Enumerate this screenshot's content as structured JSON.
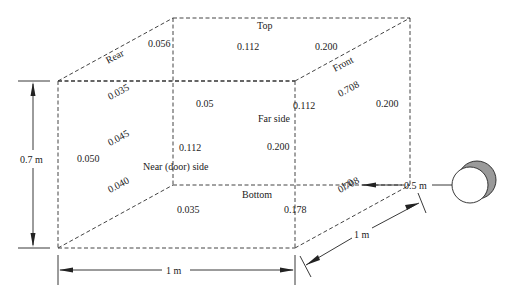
{
  "diagram": {
    "faces": {
      "top": "Top",
      "rear": "Rear",
      "front": "Front",
      "far_side": "Far side",
      "near_side": "Near (door) side",
      "bottom": "Bottom"
    },
    "values": {
      "top_rear": "0.056",
      "top_center": "0.112",
      "top_front": "0.200",
      "rear_upper": "0.035",
      "rear_mid": "0.045",
      "rear_lower": "0.040",
      "near_left": "0.050",
      "near_top": "0.05",
      "near_inner": "0.112",
      "far_top": "0.112",
      "far_mid": "0.200",
      "front_upper": "0.708",
      "front_right": "0.200",
      "front_source": "1.0",
      "bottom_front": "0.708",
      "bottom_center": "0.035",
      "bottom_edge": "0.178"
    },
    "dimensions": {
      "height": "0.7 m",
      "width": "1 m",
      "depth": "1 m",
      "source_distance": "0.5 m"
    },
    "source": {
      "shape": "sphere",
      "shade_color": "#9a9a9a"
    }
  }
}
